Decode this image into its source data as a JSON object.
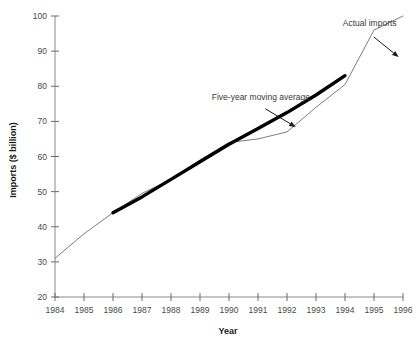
{
  "chart_data": {
    "type": "line",
    "title": "",
    "xlabel": "Year",
    "ylabel": "Imports ($ billion)",
    "x": [
      1984,
      1985,
      1986,
      1987,
      1988,
      1989,
      1990,
      1991,
      1992,
      1993,
      1994,
      1995,
      1996
    ],
    "xlim": [
      1984,
      1996
    ],
    "ylim": [
      20,
      100
    ],
    "xticks": [
      "1984",
      "1985",
      "1986",
      "1987",
      "1988",
      "1989",
      "1990",
      "1991",
      "1992",
      "1993",
      "1994",
      "1995",
      "1996"
    ],
    "yticks": [
      "20",
      "30",
      "40",
      "50",
      "60",
      "70",
      "80",
      "90",
      "100"
    ],
    "grid": false,
    "legend_position": "none",
    "series": [
      {
        "name": "Actual imports",
        "style": "thin",
        "color": "#7d7d7d",
        "x": [
          1984,
          1985,
          1986,
          1987,
          1988,
          1989,
          1990,
          1991,
          1992,
          1993,
          1994,
          1995,
          1996
        ],
        "values": [
          31,
          38,
          44,
          49.5,
          53.5,
          59,
          64,
          65,
          67,
          74,
          80.5,
          96,
          100
        ]
      },
      {
        "name": "Five-year moving average",
        "style": "thick",
        "color": "#000000",
        "x": [
          1986,
          1987,
          1988,
          1989,
          1990,
          1991,
          1992,
          1993,
          1994
        ],
        "values": [
          44,
          48.5,
          53.5,
          58.5,
          63.5,
          68,
          72.5,
          77.5,
          83
        ]
      }
    ],
    "annotations": [
      {
        "text": "Actual imports",
        "text_x": 1994.85,
        "text_y": 97.2,
        "anchor": "middle",
        "arrow_from_x": 1995.0,
        "arrow_from_y": 94.0,
        "arrow_to_x": 1995.85,
        "arrow_to_y": 88.3
      },
      {
        "text": "Five-year moving average",
        "text_x": 1991.1,
        "text_y": 76.2,
        "anchor": "middle",
        "arrow_from_x": 1991.25,
        "arrow_from_y": 73.6,
        "arrow_to_x": 1992.3,
        "arrow_to_y": 68.4
      }
    ]
  }
}
